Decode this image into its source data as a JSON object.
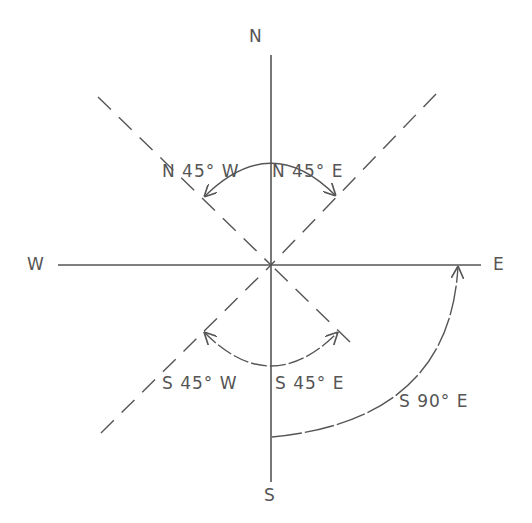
{
  "diagram": {
    "cardinals": {
      "north": "N",
      "south": "S",
      "east": "E",
      "west": "W"
    },
    "bearings": [
      {
        "id": "n45w",
        "label": "N 45° W"
      },
      {
        "id": "n45e",
        "label": "N 45° E"
      },
      {
        "id": "s45w",
        "label": "S 45° W"
      },
      {
        "id": "s45e",
        "label": "S 45° E"
      },
      {
        "id": "s90e",
        "label": "S 90° E"
      }
    ],
    "colors": {
      "line": "#555555",
      "text": "#555555",
      "background": "#ffffff"
    }
  }
}
